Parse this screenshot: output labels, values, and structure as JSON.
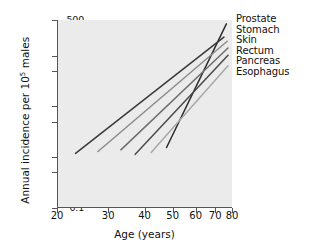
{
  "chart_data": {
    "type": "line",
    "title": "",
    "xlabel": "Age (years)",
    "ylabel": "Annual incidence per 10⁵ males",
    "ylabel_text": "Annual incidence per 10",
    "ylabel_sup": "5",
    "ylabel_tail": " males",
    "xscale": "log",
    "yscale": "log",
    "xlim": [
      20,
      80
    ],
    "ylim": [
      0.1,
      500
    ],
    "grid": false,
    "legend_position": "right",
    "xticks": [
      20,
      30,
      40,
      50,
      60,
      70,
      80
    ],
    "xticklabels": [
      "20",
      "30",
      "40",
      "50",
      "60",
      "70",
      "80"
    ],
    "yticks": [
      0.1,
      0.5,
      1,
      5,
      10,
      50,
      100,
      500
    ],
    "yticklabels": [
      "0.1",
      "0.5",
      "1",
      "5",
      "10",
      "50",
      "100",
      "500"
    ],
    "series": [
      {
        "name": "Prostate",
        "color": "#2b2b2b",
        "x": [
          47.5,
          76.5
        ],
        "y": [
          1.5,
          420
        ],
        "points": [
          [
            47.5,
            1.5
          ],
          [
            76.5,
            420
          ]
        ]
      },
      {
        "name": "Stomach",
        "color": "#3a3a3a",
        "x": [
          23.0,
          75.0
        ],
        "y": [
          1.15,
          230
        ],
        "points": [
          [
            23.0,
            1.15
          ],
          [
            75.0,
            230
          ]
        ]
      },
      {
        "name": "Skin",
        "color": "#8c8c8c",
        "x": [
          27.5,
          77.0
        ],
        "y": [
          1.25,
          190
        ],
        "points": [
          [
            27.5,
            1.25
          ],
          [
            77.0,
            190
          ]
        ]
      },
      {
        "name": "Rectum",
        "color": "#6e6e6e",
        "x": [
          33.0,
          77.5
        ],
        "y": [
          1.35,
          140
        ],
        "points": [
          [
            33.0,
            1.35
          ],
          [
            77.5,
            140
          ]
        ]
      },
      {
        "name": "Pancreas",
        "color": "#4a4a4a",
        "x": [
          37.0,
          77.5
        ],
        "y": [
          1.1,
          100
        ],
        "points": [
          [
            37.0,
            1.1
          ],
          [
            77.5,
            100
          ]
        ]
      },
      {
        "name": "Esophagus",
        "color": "#a8a8a8",
        "x": [
          42.0,
          77.5
        ],
        "y": [
          1.2,
          62
        ],
        "points": [
          [
            42.0,
            1.2
          ],
          [
            77.5,
            62
          ]
        ]
      }
    ]
  }
}
